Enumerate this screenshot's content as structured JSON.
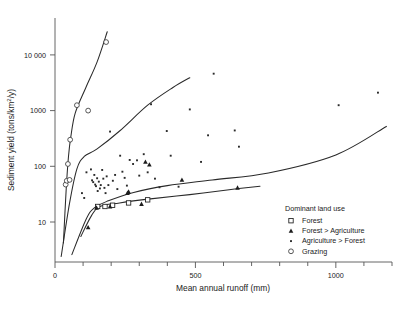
{
  "figure": {
    "caption_fragment": ""
  },
  "axes": {
    "x": {
      "title": "Mean annual runoff (mm)",
      "ticks": [
        0,
        100,
        200,
        300,
        400,
        500,
        600,
        700,
        800,
        900,
        1000,
        1100,
        1200
      ],
      "labeled_ticks": [
        {
          "value": 0,
          "label": "0"
        },
        {
          "value": 500,
          "label": "500"
        },
        {
          "value": 1000,
          "label": "1000"
        }
      ],
      "range": [
        0,
        1200
      ]
    },
    "y": {
      "title": "Sediment yield (tons/km²/y)",
      "scale": "log",
      "ticks": [
        10,
        100,
        1000,
        10000
      ],
      "tick_labels": [
        "10",
        "100",
        "1000",
        "10 000"
      ],
      "range": [
        2,
        30000
      ]
    }
  },
  "legend": {
    "title": "Dominant land use",
    "items": [
      {
        "label": "Forest",
        "marker": "open-square",
        "color": "#1d1d1d"
      },
      {
        "label": "Forest > Agriculture",
        "marker": "filled-triangle",
        "color": "#1d1d1d"
      },
      {
        "label": "Agriculture > Forest",
        "marker": "small-dot",
        "color": "#2a2a2a"
      },
      {
        "label": "Grazing",
        "marker": "open-circle",
        "color": "#3a3a3a"
      }
    ]
  },
  "chart_data": {
    "type": "scatter",
    "title": "",
    "xlabel": "Mean annual runoff (mm)",
    "ylabel": "Sediment yield (tons/km²/y)",
    "xscale": "linear",
    "yscale": "log",
    "xlim": [
      0,
      1200
    ],
    "ylim": [
      2,
      30000
    ],
    "grid": false,
    "legend_position": "lower-right-inside",
    "series": [
      {
        "name": "Forest",
        "marker": "open-square",
        "points": [
          {
            "x": 152,
            "y": 19
          },
          {
            "x": 178,
            "y": 19
          },
          {
            "x": 205,
            "y": 20
          },
          {
            "x": 262,
            "y": 22
          },
          {
            "x": 330,
            "y": 25
          }
        ]
      },
      {
        "name": "Forest > Agriculture",
        "marker": "filled-triangle",
        "points": [
          {
            "x": 118,
            "y": 8
          },
          {
            "x": 148,
            "y": 18
          },
          {
            "x": 196,
            "y": 19
          },
          {
            "x": 258,
            "y": 33
          },
          {
            "x": 262,
            "y": 35
          },
          {
            "x": 308,
            "y": 21
          },
          {
            "x": 322,
            "y": 120
          },
          {
            "x": 336,
            "y": 107
          },
          {
            "x": 452,
            "y": 57
          },
          {
            "x": 650,
            "y": 41
          }
        ]
      },
      {
        "name": "Agriculture > Forest",
        "marker": "small-dot",
        "points": [
          {
            "x": 96,
            "y": 33
          },
          {
            "x": 104,
            "y": 27
          },
          {
            "x": 112,
            "y": 78
          },
          {
            "x": 128,
            "y": 88
          },
          {
            "x": 132,
            "y": 56
          },
          {
            "x": 136,
            "y": 52
          },
          {
            "x": 140,
            "y": 70
          },
          {
            "x": 143,
            "y": 47
          },
          {
            "x": 146,
            "y": 44
          },
          {
            "x": 150,
            "y": 61
          },
          {
            "x": 152,
            "y": 36
          },
          {
            "x": 156,
            "y": 53
          },
          {
            "x": 160,
            "y": 40
          },
          {
            "x": 163,
            "y": 46
          },
          {
            "x": 168,
            "y": 86
          },
          {
            "x": 172,
            "y": 60
          },
          {
            "x": 176,
            "y": 41
          },
          {
            "x": 180,
            "y": 33
          },
          {
            "x": 184,
            "y": 66
          },
          {
            "x": 190,
            "y": 46
          },
          {
            "x": 196,
            "y": 420
          },
          {
            "x": 206,
            "y": 55
          },
          {
            "x": 214,
            "y": 70
          },
          {
            "x": 222,
            "y": 39
          },
          {
            "x": 232,
            "y": 155
          },
          {
            "x": 240,
            "y": 80
          },
          {
            "x": 248,
            "y": 62
          },
          {
            "x": 256,
            "y": 45
          },
          {
            "x": 266,
            "y": 130
          },
          {
            "x": 278,
            "y": 110
          },
          {
            "x": 292,
            "y": 128
          },
          {
            "x": 300,
            "y": 68
          },
          {
            "x": 316,
            "y": 165
          },
          {
            "x": 330,
            "y": 78
          },
          {
            "x": 342,
            "y": 1300
          },
          {
            "x": 356,
            "y": 60
          },
          {
            "x": 372,
            "y": 42
          },
          {
            "x": 398,
            "y": 430
          },
          {
            "x": 412,
            "y": 155
          },
          {
            "x": 440,
            "y": 43
          },
          {
            "x": 480,
            "y": 1050
          },
          {
            "x": 520,
            "y": 120
          },
          {
            "x": 545,
            "y": 360
          },
          {
            "x": 565,
            "y": 4600
          },
          {
            "x": 640,
            "y": 440
          },
          {
            "x": 655,
            "y": 225
          },
          {
            "x": 1010,
            "y": 1250
          },
          {
            "x": 1150,
            "y": 2100
          }
        ]
      },
      {
        "name": "Grazing",
        "marker": "open-circle",
        "points": [
          {
            "x": 38,
            "y": 47
          },
          {
            "x": 42,
            "y": 55
          },
          {
            "x": 46,
            "y": 110
          },
          {
            "x": 52,
            "y": 57
          },
          {
            "x": 54,
            "y": 300
          },
          {
            "x": 78,
            "y": 1250
          },
          {
            "x": 118,
            "y": 1000
          },
          {
            "x": 182,
            "y": 17000
          }
        ]
      }
    ],
    "envelope_curves": [
      {
        "name": "grazing-envelope",
        "points": [
          {
            "x": 30,
            "y": 4.2
          },
          {
            "x": 40,
            "y": 40
          },
          {
            "x": 48,
            "y": 150
          },
          {
            "x": 56,
            "y": 330
          },
          {
            "x": 72,
            "y": 900
          },
          {
            "x": 110,
            "y": 2600
          },
          {
            "x": 150,
            "y": 7500
          },
          {
            "x": 186,
            "y": 26000
          }
        ]
      },
      {
        "name": "agriculture-envelope",
        "points": [
          {
            "x": 22,
            "y": 2.4
          },
          {
            "x": 52,
            "y": 22
          },
          {
            "x": 78,
            "y": 90
          },
          {
            "x": 104,
            "y": 150
          },
          {
            "x": 150,
            "y": 205
          },
          {
            "x": 230,
            "y": 430
          },
          {
            "x": 330,
            "y": 1250
          },
          {
            "x": 420,
            "y": 2600
          },
          {
            "x": 480,
            "y": 3900
          }
        ]
      },
      {
        "name": "forest-agriculture-envelope",
        "points": [
          {
            "x": 60,
            "y": 2.6
          },
          {
            "x": 110,
            "y": 11
          },
          {
            "x": 140,
            "y": 18
          },
          {
            "x": 190,
            "y": 24
          },
          {
            "x": 280,
            "y": 34
          },
          {
            "x": 400,
            "y": 45
          },
          {
            "x": 560,
            "y": 57
          },
          {
            "x": 760,
            "y": 76
          },
          {
            "x": 1000,
            "y": 160
          },
          {
            "x": 1180,
            "y": 520
          }
        ]
      },
      {
        "name": "forest-envelope",
        "points": [
          {
            "x": 92,
            "y": 5.5
          },
          {
            "x": 130,
            "y": 13
          },
          {
            "x": 160,
            "y": 19
          },
          {
            "x": 230,
            "y": 22
          },
          {
            "x": 340,
            "y": 26
          },
          {
            "x": 480,
            "y": 31
          },
          {
            "x": 620,
            "y": 38
          },
          {
            "x": 730,
            "y": 44
          }
        ]
      }
    ]
  }
}
